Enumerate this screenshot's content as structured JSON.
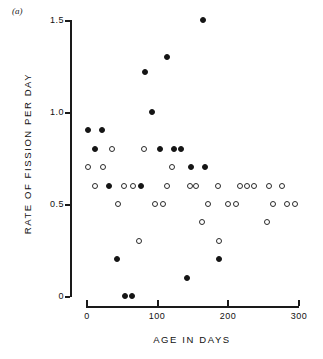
{
  "figure": {
    "panel_label": "(a)",
    "ylabel": "RATE OF FISSION PER DAY",
    "xlabel": "AGE IN DAYS"
  },
  "axes": {
    "y_ticks": [
      "1.5",
      "1.0",
      "0.5",
      "0"
    ],
    "x_ticks": [
      "0",
      "100",
      "200",
      "300"
    ]
  },
  "chart_data": {
    "type": "scatter",
    "title": "",
    "xlabel": "AGE IN DAYS",
    "ylabel": "RATE OF FISSION PER DAY",
    "xlim": [
      0,
      300
    ],
    "ylim": [
      0,
      1.5
    ],
    "xticks": [
      0,
      100,
      200,
      300
    ],
    "yticks": [
      0,
      0.5,
      1.0,
      1.5
    ],
    "grid": false,
    "legend": "none",
    "marker_colors": {
      "filled": "#151515",
      "open": "#ffffff",
      "open_edge": "#2a2a2a"
    },
    "series": [
      {
        "name": "filled",
        "marker": "filled-circle",
        "points": [
          [
            165,
            1.5
          ],
          [
            115,
            1.3
          ],
          [
            84,
            1.22
          ],
          [
            94,
            1.0
          ],
          [
            3,
            0.9
          ],
          [
            23,
            0.9
          ],
          [
            13,
            0.8
          ],
          [
            105,
            0.8
          ],
          [
            125,
            0.8
          ],
          [
            135,
            0.8
          ],
          [
            149,
            0.7
          ],
          [
            169,
            0.7
          ],
          [
            33,
            0.6
          ],
          [
            78,
            0.6
          ],
          [
            44,
            0.2
          ],
          [
            188,
            0.2
          ],
          [
            143,
            0.1
          ],
          [
            55,
            0.0
          ],
          [
            65,
            0.0
          ]
        ]
      },
      {
        "name": "open",
        "marker": "open-circle",
        "points": [
          [
            37,
            0.8
          ],
          [
            82,
            0.8
          ],
          [
            3,
            0.7
          ],
          [
            24,
            0.7
          ],
          [
            122,
            0.7
          ],
          [
            13,
            0.6
          ],
          [
            54,
            0.6
          ],
          [
            67,
            0.6
          ],
          [
            115,
            0.6
          ],
          [
            147,
            0.6
          ],
          [
            156,
            0.6
          ],
          [
            187,
            0.6
          ],
          [
            218,
            0.6
          ],
          [
            228,
            0.6
          ],
          [
            238,
            0.6
          ],
          [
            259,
            0.6
          ],
          [
            278,
            0.6
          ],
          [
            45,
            0.5
          ],
          [
            98,
            0.5
          ],
          [
            109,
            0.5
          ],
          [
            173,
            0.5
          ],
          [
            201,
            0.5
          ],
          [
            212,
            0.5
          ],
          [
            264,
            0.5
          ],
          [
            285,
            0.5
          ],
          [
            296,
            0.5
          ],
          [
            164,
            0.4
          ],
          [
            256,
            0.4
          ],
          [
            75,
            0.3
          ],
          [
            188,
            0.3
          ]
        ]
      }
    ]
  }
}
